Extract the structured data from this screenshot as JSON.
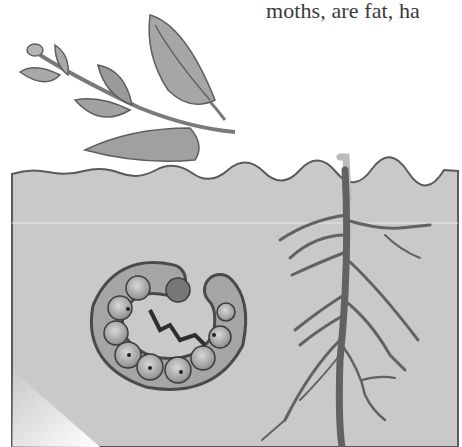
{
  "caption": {
    "text": "moths, are fat, ha"
  },
  "illustration": {
    "subject": "cutworm curled in soil beneath a plant with roots",
    "elements": [
      "plant-stem-with-leaves",
      "soil-cross-section",
      "cutworm-larva",
      "plant-root-system"
    ],
    "colors": {
      "soil": "#c9c9c9",
      "soil_border": "#5a5a5a",
      "leaf_fill": "#a8a8a8",
      "leaf_dark": "#6e6e6e",
      "root": "#6a6a6a",
      "worm_body": "#9a9a9a",
      "worm_dark": "#3c3c3c",
      "background": "#ffffff"
    }
  }
}
